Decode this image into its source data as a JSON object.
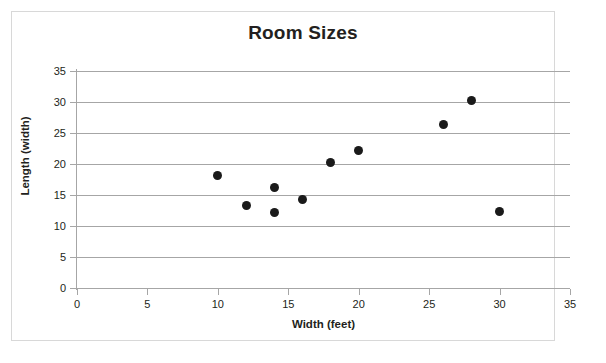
{
  "chart_data": {
    "type": "scatter",
    "title": "Room Sizes",
    "xlabel": "Width (feet)",
    "ylabel": "Length (width)",
    "xlim": [
      0,
      35
    ],
    "ylim": [
      0,
      35
    ],
    "xticks": [
      0,
      5,
      10,
      15,
      20,
      25,
      30,
      35
    ],
    "yticks": [
      0,
      5,
      10,
      15,
      20,
      25,
      30,
      35
    ],
    "grid": "horizontal",
    "legend": "none",
    "marker_color": "#1a1a1a",
    "gridline_color": "#a6a6a6",
    "points": [
      {
        "x": 10,
        "y": 18.1
      },
      {
        "x": 12,
        "y": 13.3
      },
      {
        "x": 14,
        "y": 16.2
      },
      {
        "x": 14,
        "y": 12.2
      },
      {
        "x": 16,
        "y": 14.3
      },
      {
        "x": 18,
        "y": 20.2
      },
      {
        "x": 20,
        "y": 22.2
      },
      {
        "x": 26,
        "y": 26.3
      },
      {
        "x": 28,
        "y": 30.3
      },
      {
        "x": 30,
        "y": 12.4
      }
    ]
  }
}
